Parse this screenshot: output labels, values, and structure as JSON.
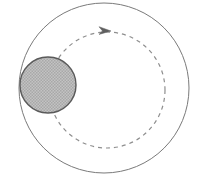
{
  "figure": {
    "title": "Circular orbit diagram",
    "width": 197,
    "height": 179,
    "background_color": "#ffffff",
    "caption": ""
  },
  "colors": {
    "outer_circle_stroke": "#7a7a7a",
    "orbit_dash_stroke": "#8e8e8e",
    "body_fill": "#b9b9b9",
    "body_pattern_dot": "#9a9a9a",
    "body_stroke": "#5a5a5a",
    "arrow_color": "#5f5f5f",
    "background": "#ffffff"
  },
  "chart_data": {
    "type": "diagram",
    "title": "Circular orbit diagram",
    "shapes": [
      {
        "name": "outer-boundary-circle",
        "kind": "circle",
        "style": "solid",
        "cx": 104,
        "cy": 88,
        "r": 85,
        "stroke": "#7a7a7a",
        "stroke_width": 1,
        "fill": "none"
      },
      {
        "name": "orbit-path-circle",
        "kind": "circle",
        "style": "dashed",
        "cx": 107,
        "cy": 90,
        "r": 58,
        "stroke": "#8e8e8e",
        "stroke_width": 1.2,
        "dash_pattern": "4 4",
        "fill": "none"
      },
      {
        "name": "shaded-body-circle",
        "kind": "circle",
        "style": "filled-hatched",
        "cx": 48,
        "cy": 85,
        "r": 28,
        "stroke": "#5a5a5a",
        "stroke_width": 1.4,
        "fill": "#b9b9b9"
      }
    ],
    "annotations": [
      {
        "name": "orbit-direction-arrow",
        "kind": "arrowhead",
        "x": 107,
        "y": 30,
        "direction": "right",
        "meaning": "clockwise orbital motion",
        "color": "#5f5f5f"
      }
    ],
    "labels": [],
    "legend": [],
    "grid": false
  }
}
